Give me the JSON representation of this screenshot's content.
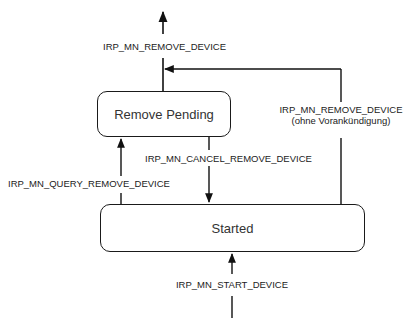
{
  "diagram": {
    "type": "state-diagram",
    "states": [
      {
        "id": "remove_pending",
        "label": "Remove Pending"
      },
      {
        "id": "started",
        "label": "Started"
      }
    ],
    "transitions": [
      {
        "id": "remove_from_pending",
        "from": "remove_pending",
        "to": "(exit)",
        "label": "IRP_MN_REMOVE_DEVICE"
      },
      {
        "id": "surprise_remove",
        "from": "started",
        "to": "(exit)",
        "label": "IRP_MN_REMOVE_DEVICE",
        "sublabel": "(ohne Vorankündigung)"
      },
      {
        "id": "cancel_remove",
        "from": "remove_pending",
        "to": "started",
        "label": "IRP_MN_CANCEL_REMOVE_DEVICE"
      },
      {
        "id": "query_remove",
        "from": "started",
        "to": "remove_pending",
        "label": "IRP_MN_QUERY_REMOVE_DEVICE"
      },
      {
        "id": "start_device",
        "from": "(entry)",
        "to": "started",
        "label": "IRP_MN_START_DEVICE"
      }
    ]
  }
}
